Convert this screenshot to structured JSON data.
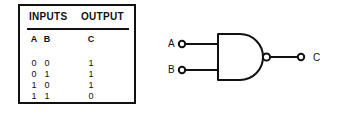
{
  "figure": {
    "kind": "logic-gate-truth-table",
    "gate_name": "NAND"
  },
  "table": {
    "group_headers": {
      "inputs": "INPUTS",
      "output": "OUTPUT"
    },
    "columns": [
      "A",
      "B",
      "C"
    ],
    "rows": [
      {
        "a": "0",
        "b": "0",
        "c": "1"
      },
      {
        "a": "0",
        "b": "1",
        "c": "1"
      },
      {
        "a": "1",
        "b": "0",
        "c": "1"
      },
      {
        "a": "1",
        "b": "1",
        "c": "0"
      }
    ]
  },
  "diagram": {
    "input_labels": [
      "A",
      "B"
    ],
    "output_label": "C",
    "colors": {
      "line": "#111111",
      "background": "#ffffff"
    }
  }
}
